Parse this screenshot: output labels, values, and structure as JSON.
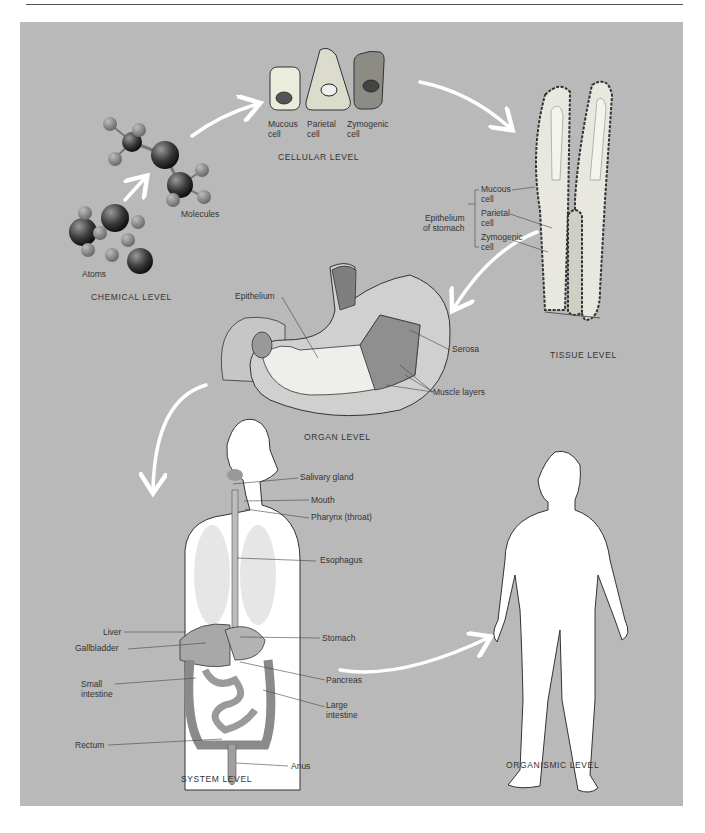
{
  "figure": {
    "background_color": "#b9b9b9",
    "levels": [
      {
        "id": "chemical",
        "label": "CHEMICAL LEVEL"
      },
      {
        "id": "cellular",
        "label": "CELLULAR LEVEL"
      },
      {
        "id": "tissue",
        "label": "TISSUE LEVEL"
      },
      {
        "id": "organ",
        "label": "ORGAN LEVEL"
      },
      {
        "id": "system",
        "label": "SYSTEM LEVEL"
      },
      {
        "id": "organismic",
        "label": "ORGANISMIC LEVEL"
      }
    ],
    "chemical": {
      "atoms_label": "Atoms",
      "molecules_label": "Molecules"
    },
    "cellular": {
      "cells": [
        {
          "label": "Mucous\ncell",
          "color": "#ececdc"
        },
        {
          "label": "Parietal\ncell",
          "color": "#dcdccc"
        },
        {
          "label": "Zymogenic\ncell",
          "color": "#8c8c84"
        }
      ]
    },
    "tissue": {
      "group_label": "Epithelium\nof stomach",
      "cell_labels": [
        "Mucous\ncell",
        "Parietal\ncell",
        "Zymogenic\ncell"
      ]
    },
    "organ": {
      "labels": {
        "epithelium": "Epithelium",
        "serosa": "Serosa",
        "muscle_layers": "Muscle layers"
      }
    },
    "system": {
      "labels_right": [
        "Salivary gland",
        "Mouth",
        "Pharynx (throat)",
        "Esophagus",
        "Stomach",
        "Pancreas",
        "Large\nintestine",
        "Anus"
      ],
      "labels_left": [
        "Liver",
        "Gallbladder",
        "Small\nintestine",
        "Rectum"
      ]
    }
  }
}
